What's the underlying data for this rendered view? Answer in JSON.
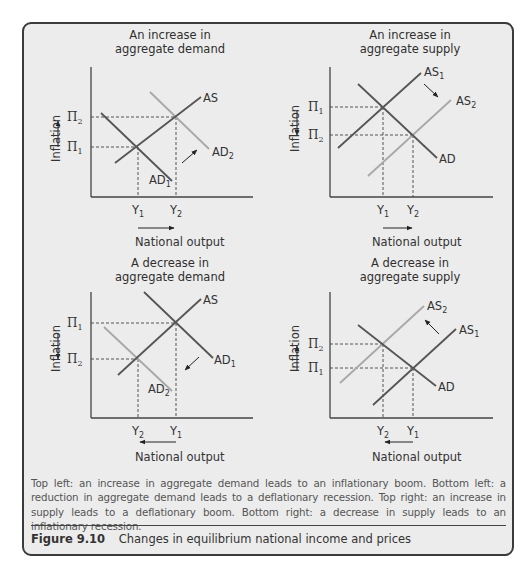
{
  "figure": {
    "number": "Figure 9.10",
    "title": "Changes in equilibrium national income and prices",
    "caption": "Top left: an increase in aggregate demand leads to an inflationary boom. Bottom left: a reduction in aggregate demand leads to a deflationary recession. Top right: an increase in supply leads to a deflationary boom. Bottom right: a decrease in supply leads to an inflationary recession."
  },
  "colors": {
    "frame": "#3b3b3b",
    "background": "#ececec",
    "original_curve": "#555555",
    "shifted_curve": "#a8a8a8",
    "text": "#333333"
  },
  "panels": [
    {
      "title_line1": "An increase in",
      "title_line2": "aggregate demand",
      "ylabel": "Inflation",
      "xlabel": "National output",
      "pi_top": "Π2",
      "pi_bottom": "Π1",
      "y_left": "Y1",
      "y_right": "Y2",
      "curves": {
        "as": "AS",
        "ad_orig": "AD1",
        "ad_new": "AD2"
      }
    },
    {
      "title_line1": "An increase in",
      "title_line2": "aggregate supply",
      "ylabel": "Inflation",
      "xlabel": "National output",
      "pi_top": "Π1",
      "pi_bottom": "Π2",
      "y_left": "Y1",
      "y_right": "Y2",
      "curves": {
        "as_orig": "AS1",
        "as_new": "AS2",
        "ad": "AD"
      }
    },
    {
      "title_line1": "A decrease in",
      "title_line2": "aggregate demand",
      "ylabel": "Inflation",
      "xlabel": "National output",
      "pi_top": "Π1",
      "pi_bottom": "Π2",
      "y_left": "Y2",
      "y_right": "Y1",
      "curves": {
        "as": "AS",
        "ad_orig": "AD1",
        "ad_new": "AD2"
      }
    },
    {
      "title_line1": "A decrease in",
      "title_line2": "aggregate supply",
      "ylabel": "Inflation",
      "xlabel": "National output",
      "pi_top": "Π2",
      "pi_bottom": "Π1",
      "y_left": "Y2",
      "y_right": "Y1",
      "curves": {
        "as_orig": "AS1",
        "as_new": "AS2",
        "ad": "AD"
      }
    }
  ],
  "chart_data": [
    {
      "type": "line",
      "title": "An increase in aggregate demand",
      "xlabel": "National output",
      "ylabel": "Inflation",
      "series": [
        {
          "name": "AS",
          "from": [
            0.15,
            0.25
          ],
          "to": [
            0.67,
            0.77
          ]
        },
        {
          "name": "AD1",
          "from": [
            0.06,
            0.65
          ],
          "to": [
            0.5,
            0.11
          ]
        },
        {
          "name": "AD2",
          "from": [
            0.36,
            0.81
          ],
          "to": [
            0.73,
            0.36
          ]
        }
      ],
      "equilibria": [
        {
          "label": "Y1/Π1",
          "x": "Y1",
          "y": "Π1"
        },
        {
          "label": "Y2/Π2",
          "x": "Y2",
          "y": "Π2"
        }
      ],
      "shift": "AD right",
      "grid": false
    },
    {
      "type": "line",
      "title": "An increase in aggregate supply",
      "xlabel": "National output",
      "ylabel": "Inflation",
      "series": [
        {
          "name": "AS1",
          "from": [
            0.05,
            0.37
          ],
          "to": [
            0.55,
            0.95
          ]
        },
        {
          "name": "AD",
          "from": [
            0.17,
            0.87
          ],
          "to": [
            0.65,
            0.3
          ]
        },
        {
          "name": "AS2",
          "from": [
            0.23,
            0.16
          ],
          "to": [
            0.74,
            0.75
          ]
        }
      ],
      "equilibria": [
        {
          "x": "Y1",
          "y": "Π1"
        },
        {
          "x": "Y2",
          "y": "Π2"
        }
      ],
      "shift": "AS right",
      "grid": false
    },
    {
      "type": "line",
      "title": "A decrease in aggregate demand",
      "xlabel": "National output",
      "ylabel": "Inflation",
      "series": [
        {
          "name": "AS",
          "from": [
            0.17,
            0.34
          ],
          "to": [
            0.67,
            0.94
          ]
        },
        {
          "name": "AD1",
          "from": [
            0.33,
            1.0
          ],
          "to": [
            0.75,
            0.48
          ]
        },
        {
          "name": "AD2",
          "from": [
            0.08,
            0.72
          ],
          "to": [
            0.5,
            0.21
          ]
        }
      ],
      "equilibria": [
        {
          "x": "Y1",
          "y": "Π1"
        },
        {
          "x": "Y2",
          "y": "Π2"
        }
      ],
      "shift": "AD left",
      "grid": false
    },
    {
      "type": "line",
      "title": "A decrease in aggregate supply",
      "xlabel": "National output",
      "ylabel": "Inflation",
      "series": [
        {
          "name": "AS2",
          "from": [
            0.06,
            0.28
          ],
          "to": [
            0.57,
            0.88
          ]
        },
        {
          "name": "AD",
          "from": [
            0.17,
            0.74
          ],
          "to": [
            0.64,
            0.25
          ]
        },
        {
          "name": "AS1",
          "from": [
            0.26,
            0.1
          ],
          "to": [
            0.77,
            0.7
          ]
        }
      ],
      "equilibria": [
        {
          "x": "Y1",
          "y": "Π1"
        },
        {
          "x": "Y2",
          "y": "Π2"
        }
      ],
      "shift": "AS left",
      "grid": false
    }
  ]
}
